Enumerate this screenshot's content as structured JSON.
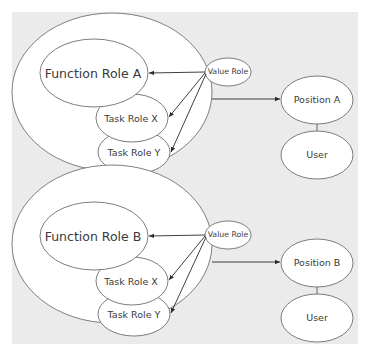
{
  "diagram": {
    "background_color": "#ebebeb",
    "groups": [
      {
        "id": "A",
        "function_role": "Function Role A",
        "value_role": "Value Role",
        "task_roles": [
          "Task Role X",
          "Task Role Y"
        ],
        "position": "Position A",
        "user": "User"
      },
      {
        "id": "B",
        "function_role": "Function Role B",
        "value_role": "Value Role",
        "task_roles": [
          "Task Role X",
          "Task Role Y"
        ],
        "position": "Position B",
        "user": "User"
      }
    ],
    "edges": [
      {
        "from": "Value Role",
        "to": "Function Role",
        "type": "arrow"
      },
      {
        "from": "Value Role",
        "to": "Task Role X",
        "type": "arrow"
      },
      {
        "from": "Value Role",
        "to": "Task Role Y",
        "type": "arrow"
      },
      {
        "from": "Role group",
        "to": "Position",
        "type": "arrow"
      },
      {
        "from": "Position",
        "to": "User",
        "type": "line"
      }
    ]
  },
  "caption": ""
}
